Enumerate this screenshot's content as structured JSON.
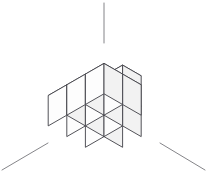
{
  "figure": {
    "name": "isometric-cube-stack",
    "title": "Isometric stack of unit cubes on three coordinate axes",
    "width": 207,
    "height": 173,
    "background_color": "#ffffff",
    "cube_count": 10
  },
  "style": {
    "edge_color": "#3f3f46",
    "edge_width": 0.9,
    "axis_color": "#77777c",
    "axis_width": 0.9,
    "face_top_color": "#ffffff",
    "face_left_color": "#fdfdfd",
    "face_right_color": "#f2f2f2",
    "seam_color": "#9a9aa0"
  },
  "projection": {
    "type": "isometric",
    "origin_x": 104,
    "origin_y": 158,
    "half_width": 18.6,
    "half_depth": 10.7,
    "cube_height": 30.4
  },
  "axes": {
    "note": "three coordinate axes meeting at the front-bottom corner of the stack",
    "lines": [
      {
        "name": "axis-vertical-z",
        "x1": 104,
        "y1": 3,
        "x2": 104,
        "y2": 43
      },
      {
        "name": "axis-left-x",
        "x1": 48,
        "y1": 143,
        "x2": 2,
        "y2": 170
      },
      {
        "name": "axis-right-y",
        "x1": 160,
        "y1": 143,
        "x2": 205,
        "y2": 170
      }
    ]
  },
  "cubes": [
    {
      "name": "cube-bottom-left-front",
      "gx": 0,
      "gy": 2,
      "gz": 0
    },
    {
      "name": "cube-bottom-left-back",
      "gx": 0,
      "gy": 1,
      "gz": 0
    },
    {
      "name": "cube-bottom-center-front",
      "gx": 1,
      "gy": 2,
      "gz": 0
    },
    {
      "name": "cube-bottom-center-back",
      "gx": 1,
      "gy": 1,
      "gz": 0
    },
    {
      "name": "cube-bottom-right-front",
      "gx": 2,
      "gy": 2,
      "gz": 0
    },
    {
      "name": "cube-bottom-right-back",
      "gx": 2,
      "gy": 1,
      "gz": 0
    },
    {
      "name": "cube-middle-back-left",
      "gx": 0,
      "gy": 0,
      "gz": 0
    },
    {
      "name": "cube-middle-back-right",
      "gx": 1,
      "gy": 0,
      "gz": 0
    },
    {
      "name": "cube-upper-back-left",
      "gx": 0,
      "gy": 0,
      "gz": 1
    },
    {
      "name": "cube-upper-back-right",
      "gx": 1,
      "gy": 0,
      "gz": 1
    }
  ]
}
